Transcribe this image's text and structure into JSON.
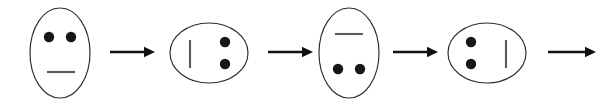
{
  "figure": {
    "background_color": "#ffffff",
    "outline_color": "#2b2b2b",
    "dot_color": "#171717",
    "mouth_color": "#5a5a5a",
    "arrow_color": "#111111",
    "width": 613,
    "height": 103
  },
  "sequence": {
    "step_count": 4,
    "arrow_count": 4,
    "rotation_step_degrees": 90,
    "items": [
      {
        "name": "face-0-degrees",
        "label": "Step 1",
        "rotation": 0,
        "orientation": "upright",
        "oval": {
          "cx": 60,
          "cy": 53,
          "rx": 30,
          "ry": 45
        },
        "eyes": [
          {
            "cx": 49,
            "cy": 37,
            "r": 5.2
          },
          {
            "cx": 71,
            "cy": 37,
            "r": 5.2
          }
        ],
        "mouth": {
          "x1": 47,
          "y1": 72,
          "x2": 75,
          "y2": 72
        }
      },
      {
        "name": "face-90-degrees",
        "label": "Step 2",
        "rotation": 90,
        "orientation": "rotated-clockwise-90",
        "oval": {
          "cx": 209,
          "cy": 53,
          "rx": 39,
          "ry": 30
        },
        "eyes": [
          {
            "cx": 225,
            "cy": 42,
            "r": 5.2
          },
          {
            "cx": 225,
            "cy": 64,
            "r": 5.2
          }
        ],
        "mouth": {
          "x1": 190,
          "y1": 40,
          "x2": 190,
          "y2": 68
        }
      },
      {
        "name": "face-180-degrees",
        "label": "Step 3",
        "rotation": 180,
        "orientation": "upside-down",
        "oval": {
          "cx": 349,
          "cy": 53,
          "rx": 30,
          "ry": 45
        },
        "eyes": [
          {
            "cx": 338,
            "cy": 69,
            "r": 5.2
          },
          {
            "cx": 360,
            "cy": 69,
            "r": 5.2
          }
        ],
        "mouth": {
          "x1": 335,
          "y1": 34,
          "x2": 363,
          "y2": 34
        }
      },
      {
        "name": "face-270-degrees",
        "label": "Step 4",
        "rotation": 270,
        "orientation": "rotated-counterclockwise-90",
        "oval": {
          "cx": 487,
          "cy": 53,
          "rx": 39,
          "ry": 30
        },
        "eyes": [
          {
            "cx": 471,
            "cy": 42,
            "r": 5.2
          },
          {
            "cx": 471,
            "cy": 64,
            "r": 5.2
          }
        ],
        "mouth": {
          "x1": 506,
          "y1": 40,
          "x2": 506,
          "y2": 68
        }
      }
    ],
    "arrows": [
      {
        "name": "arrow-1",
        "x1": 110,
        "x2": 155,
        "y": 52,
        "direction": "right"
      },
      {
        "name": "arrow-2",
        "x1": 268,
        "x2": 313,
        "y": 52,
        "direction": "right"
      },
      {
        "name": "arrow-3",
        "x1": 393,
        "x2": 438,
        "y": 52,
        "direction": "right"
      },
      {
        "name": "arrow-4",
        "x1": 548,
        "x2": 596,
        "y": 52,
        "direction": "right"
      }
    ]
  }
}
